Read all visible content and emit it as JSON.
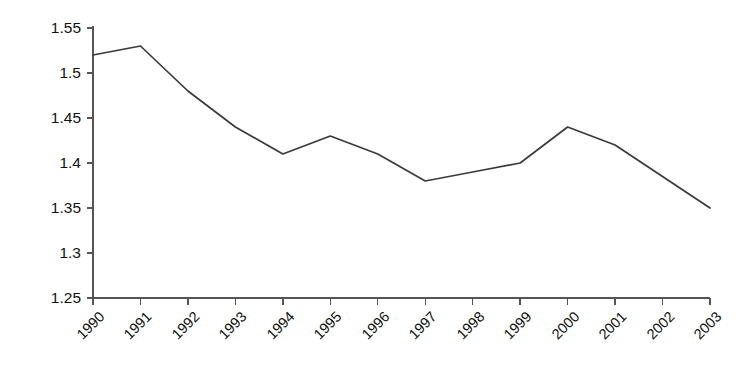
{
  "chart_data": {
    "type": "line",
    "title": "",
    "subtitle": "",
    "xlabel": "",
    "ylabel": "",
    "categories": [
      "1990",
      "1991",
      "1992",
      "1993",
      "1994",
      "1995",
      "1996",
      "1997",
      "1998",
      "1999",
      "2000",
      "2001",
      "2002",
      "2003"
    ],
    "values": [
      1.52,
      1.53,
      1.48,
      1.44,
      1.41,
      1.43,
      1.41,
      1.38,
      1.39,
      1.4,
      1.44,
      1.42,
      1.385,
      1.35
    ],
    "series": [
      {
        "name": "series-1",
        "values": [
          1.52,
          1.53,
          1.48,
          1.44,
          1.41,
          1.43,
          1.41,
          1.38,
          1.39,
          1.4,
          1.44,
          1.42,
          1.385,
          1.35
        ]
      }
    ],
    "ylim": [
      1.25,
      1.55
    ],
    "ytick_labels": [
      "1.55",
      "1.5",
      "1.45",
      "1.4",
      "1.35",
      "1.3",
      "1.25"
    ],
    "ytick_values": [
      1.55,
      1.5,
      1.45,
      1.4,
      1.35,
      1.3,
      1.25
    ],
    "ytick_step": 0.05,
    "grid": false,
    "legend": false,
    "legend_position": "none",
    "line_color": "#3a3a3a",
    "axis_color": "#555555",
    "background_color": "#ffffff",
    "xtick_rotation_deg": -45
  }
}
